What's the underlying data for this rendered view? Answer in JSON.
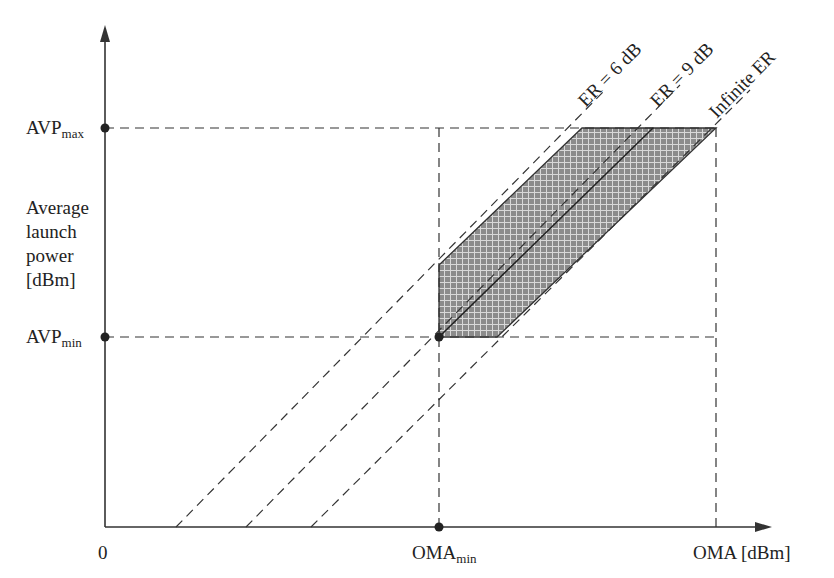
{
  "diagram": {
    "y_axis": {
      "label_lines": [
        "Average",
        "launch",
        "power",
        "[dBm]"
      ],
      "ticks": {
        "max": {
          "base": "AVP",
          "sub": "max"
        },
        "min": {
          "base": "AVP",
          "sub": "min"
        }
      }
    },
    "x_axis": {
      "origin": "0",
      "label": "OMA [dBm]",
      "ticks": {
        "min": {
          "base": "OMA",
          "sub": "min"
        }
      }
    },
    "lines": [
      {
        "label": "ER = 6 dB",
        "style": "dashed"
      },
      {
        "label": "ER = 9 dB",
        "style": "dashed + solid inside region"
      },
      {
        "label": "Infinite ER",
        "style": "dashed"
      }
    ],
    "region": {
      "fill": "crosshatched gray",
      "color": "#8a8a8a"
    },
    "colors": {
      "ink": "#222222",
      "fill": "#8c8c8c",
      "hatch": "#d8d8d8"
    }
  }
}
